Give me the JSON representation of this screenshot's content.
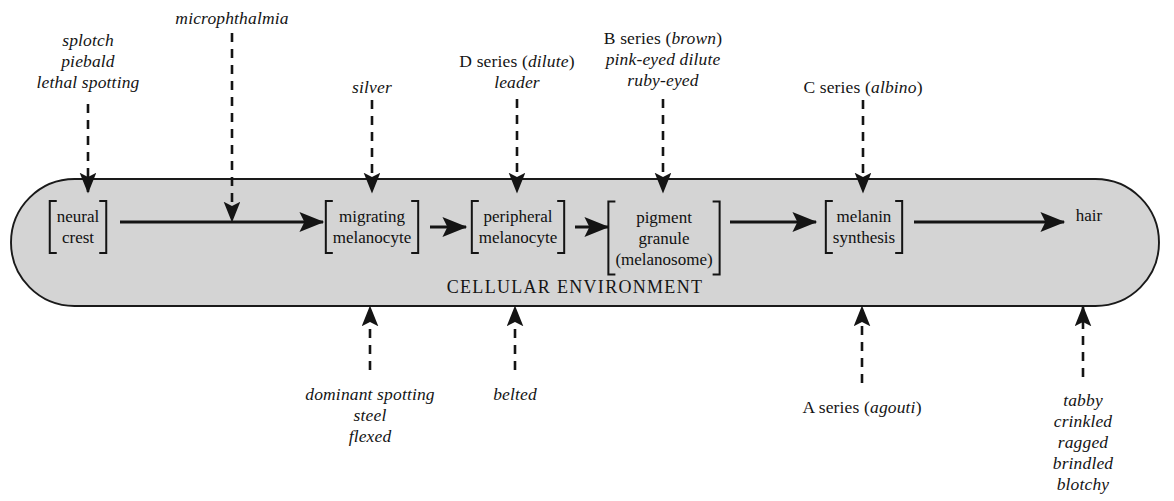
{
  "diagram": {
    "title_text": "CELLULAR ENVIRONMENT",
    "capsule": {
      "fill_color": "#d4d4d4",
      "stroke_color": "#1a1a1a"
    },
    "pathway": {
      "nodes": [
        {
          "id": "neural-crest",
          "lines": [
            "neural",
            "crest"
          ],
          "brackets": true,
          "x": 78,
          "y": 227
        },
        {
          "id": "migrating-melanocyte",
          "lines": [
            "migrating",
            "melanocyte"
          ],
          "brackets": true,
          "x": 372,
          "y": 227
        },
        {
          "id": "peripheral-melanocyte",
          "lines": [
            "peripheral",
            "melanocyte"
          ],
          "brackets": true,
          "x": 518,
          "y": 227
        },
        {
          "id": "pigment-granule",
          "lines": [
            "pigment",
            "granule",
            "(melanosome)"
          ],
          "brackets": true,
          "x": 664,
          "y": 238
        },
        {
          "id": "melanin-synthesis",
          "lines": [
            "melanin",
            "synthesis"
          ],
          "brackets": true,
          "x": 864,
          "y": 227
        },
        {
          "id": "hair",
          "lines": [
            "hair"
          ],
          "brackets": false,
          "x": 1089,
          "y": 215
        }
      ]
    },
    "top_labels": [
      {
        "id": "splotch-group",
        "lines": [
          "splotch",
          "piebald",
          "lethal spotting"
        ],
        "x": 88,
        "y": 30,
        "align": "center"
      },
      {
        "id": "microphthalmia",
        "lines": [
          "microphthalmia"
        ],
        "x": 232,
        "y": 8,
        "align": "center"
      },
      {
        "id": "silver",
        "lines": [
          "silver"
        ],
        "x": 372,
        "y": 77,
        "align": "center"
      },
      {
        "id": "d-series-leader",
        "lines": [
          "D series (dilute)",
          "leader"
        ],
        "x": 517,
        "y": 51,
        "align": "center"
      },
      {
        "id": "b-series-group",
        "lines": [
          "B series (brown)",
          "pink-eyed dilute",
          "ruby-eyed"
        ],
        "x": 663,
        "y": 28,
        "align": "center"
      },
      {
        "id": "c-series-albino",
        "lines": [
          "C series (albino)"
        ],
        "x": 863,
        "y": 77,
        "align": "center"
      }
    ],
    "bottom_labels": [
      {
        "id": "dominant-spotting-group",
        "lines": [
          "dominant spotting",
          "steel",
          "flexed"
        ],
        "x": 370,
        "y": 384,
        "align": "center"
      },
      {
        "id": "belted",
        "lines": [
          "belted"
        ],
        "x": 515,
        "y": 384,
        "align": "center"
      },
      {
        "id": "a-series-agouti",
        "lines": [
          "A series (agouti)"
        ],
        "x": 862,
        "y": 397,
        "align": "center"
      },
      {
        "id": "tabby-group",
        "lines": [
          "tabby",
          "crinkled",
          "ragged",
          "brindled",
          "blotchy"
        ],
        "x": 1083,
        "y": 390,
        "align": "center"
      }
    ],
    "top_arrows": [
      {
        "id": "arrow-splotch",
        "x": 88,
        "y1": 104,
        "y2": 192
      },
      {
        "id": "arrow-microphthalmia",
        "x": 232,
        "y1": 33,
        "y2": 221
      },
      {
        "id": "arrow-silver",
        "x": 372,
        "y1": 100,
        "y2": 192
      },
      {
        "id": "arrow-d-series",
        "x": 517,
        "y1": 99,
        "y2": 192
      },
      {
        "id": "arrow-b-series",
        "x": 663,
        "y1": 99,
        "y2": 192
      },
      {
        "id": "arrow-c-series",
        "x": 863,
        "y1": 100,
        "y2": 192
      }
    ],
    "bottom_arrows": [
      {
        "id": "arrow-dominant-spotting",
        "x": 370,
        "y1": 370,
        "y2": 307
      },
      {
        "id": "arrow-belted",
        "x": 515,
        "y1": 370,
        "y2": 307
      },
      {
        "id": "arrow-a-series",
        "x": 862,
        "y1": 383,
        "y2": 307
      },
      {
        "id": "arrow-tabby",
        "x": 1083,
        "y1": 377,
        "y2": 307
      }
    ],
    "flow_arrows": [
      {
        "id": "flow-neural-to-migrating",
        "x1": 120,
        "x2": 323,
        "y": 222
      },
      {
        "id": "flow-migrating-to-periph",
        "x1": 430,
        "x2": 466,
        "y": 227
      },
      {
        "id": "flow-periph-to-pigment",
        "x1": 575,
        "x2": 608,
        "y": 227
      },
      {
        "id": "flow-pigment-to-melanin",
        "x1": 730,
        "x2": 816,
        "y": 222
      },
      {
        "id": "flow-melanin-to-hair",
        "x1": 914,
        "x2": 1064,
        "y": 222
      }
    ]
  }
}
